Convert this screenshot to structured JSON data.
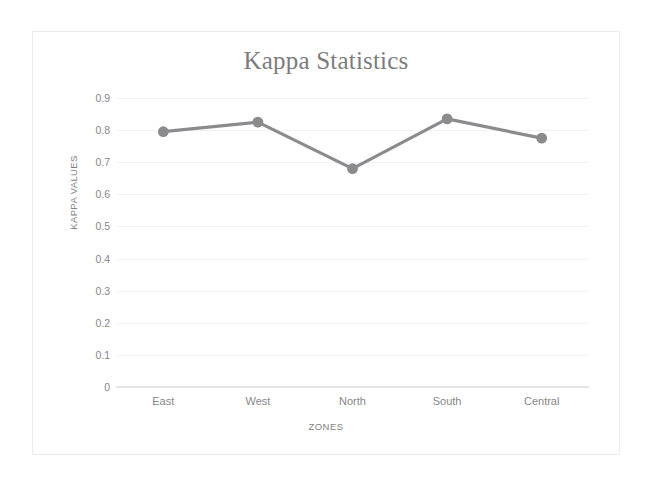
{
  "figure": {
    "title": "Kappa Statistics",
    "line_color": "#8b8b8d",
    "marker_color": "#8b8b8d",
    "grid_color": "#f2f2f3",
    "text_color": "#86868a",
    "background": "#ffffff"
  },
  "chart_data": {
    "type": "line",
    "title": "Kappa Statistics",
    "xlabel": "ZONES",
    "ylabel": "KAPPA VALUES",
    "categories": [
      "East",
      "West",
      "North",
      "South",
      "Central"
    ],
    "values": [
      0.795,
      0.825,
      0.68,
      0.835,
      0.775
    ],
    "ylim": [
      0,
      0.9
    ],
    "ytick_labels": [
      "0.9",
      "0.8",
      "0.7",
      "0.6",
      "0.5",
      "0.4",
      "0.3",
      "0.2",
      "0.1",
      "0"
    ],
    "ytick_values": [
      0.9,
      0.8,
      0.7,
      0.6,
      0.5,
      0.4,
      0.3,
      0.2,
      0.1,
      0
    ],
    "grid": "horizontal",
    "legend": "none",
    "markers": "circle",
    "series": [
      {
        "name": "Kappa",
        "values": [
          0.795,
          0.825,
          0.68,
          0.835,
          0.775
        ]
      }
    ]
  }
}
